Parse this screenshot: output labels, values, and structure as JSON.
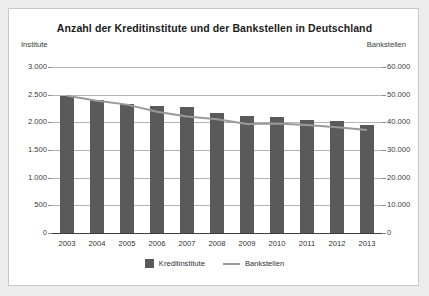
{
  "chart_data": {
    "type": "bar",
    "title": "Anzahl der Kreditinstitute und der Bankstellen in Deutschland",
    "xlabel": "",
    "ylabel": "Institute",
    "y2label": "Bankstellen",
    "categories": [
      "2003",
      "2004",
      "2005",
      "2006",
      "2007",
      "2008",
      "2009",
      "2010",
      "2011",
      "2012",
      "2013"
    ],
    "ylim": [
      0,
      3000
    ],
    "y2lim": [
      0,
      60000
    ],
    "yticks": [
      "0",
      "500",
      "1.000",
      "1.500",
      "2.000",
      "2.500",
      "3.000"
    ],
    "ytick_values": [
      0,
      500,
      1000,
      1500,
      2000,
      2500,
      3000
    ],
    "y2ticks": [
      "0",
      "10.000",
      "20.000",
      "30.000",
      "40.000",
      "50.000",
      "60.000"
    ],
    "y2tick_values": [
      0,
      10000,
      20000,
      30000,
      40000,
      50000,
      60000
    ],
    "grid": true,
    "legend_position": "bottom",
    "series": [
      {
        "name": "Kreditinstitute",
        "type": "bar",
        "axis": "left",
        "color": "#5a5a5a",
        "values": [
          2470,
          2400,
          2340,
          2300,
          2280,
          2170,
          2120,
          2090,
          2050,
          2030,
          1960
        ]
      },
      {
        "name": "Bankstellen",
        "type": "line",
        "axis": "right",
        "color": "#9a9a9a",
        "values": [
          49600,
          47800,
          46400,
          43800,
          42100,
          41100,
          39400,
          39600,
          39000,
          38200,
          37200
        ]
      }
    ]
  },
  "legend": {
    "items": [
      {
        "label": "Kreditinstitute",
        "marker": "bar-swatch"
      },
      {
        "label": "Bankstellen",
        "marker": "line-swatch"
      }
    ]
  }
}
